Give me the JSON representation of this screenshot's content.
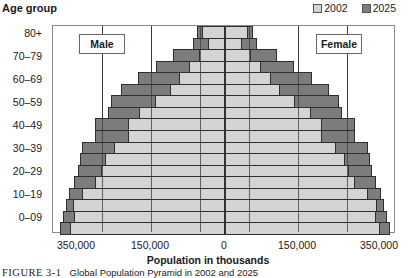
{
  "chart_data": {
    "type": "bar",
    "subtype": "population-pyramid",
    "title": "",
    "ylabel": "Age group",
    "xlabel": "Population in thousands",
    "categories": [
      "80+",
      "70–79",
      "60–69",
      "50–59",
      "40–49",
      "30–39",
      "20–29",
      "10–19",
      "0–09"
    ],
    "xticks": [
      "350,000",
      "150,000",
      "0",
      "150,000",
      "350,000"
    ],
    "xlim": [
      -350000,
      350000
    ],
    "gridlines_thousands": [
      -250000,
      -150000,
      -50000,
      0,
      50000,
      150000,
      250000
    ],
    "legend": [
      "2002",
      "2025"
    ],
    "legend_position": "top-right",
    "panels": [
      "Male",
      "Female"
    ],
    "note": "Each age group is drawn as two stacked sub-bars (upper and lower half of the decade); values in thousands, estimated from pixel extents.",
    "series": [
      {
        "name": "2002",
        "color": "#d4d4d4",
        "male": [
          47000,
          35000,
          53000,
          73000,
          93000,
          112000,
          142000,
          175000,
          198000,
          198000,
          225000,
          244000,
          252000,
          265000,
          290000,
          309000,
          307000,
          315000
        ],
        "female": [
          47000,
          35000,
          53000,
          73000,
          93000,
          112000,
          142000,
          175000,
          198000,
          198000,
          225000,
          244000,
          252000,
          265000,
          290000,
          309000,
          307000,
          315000
        ]
      },
      {
        "name": "2025",
        "color": "#7c7c7c",
        "male": [
          57000,
          65000,
          106000,
          140000,
          177000,
          212000,
          232000,
          238000,
          265000,
          265000,
          291000,
          295000,
          299000,
          307000,
          318000,
          324000,
          330000,
          336000
        ],
        "female": [
          57000,
          65000,
          106000,
          140000,
          177000,
          212000,
          232000,
          238000,
          265000,
          265000,
          291000,
          295000,
          299000,
          307000,
          318000,
          324000,
          330000,
          336000
        ]
      }
    ]
  },
  "header": {
    "y_title": "Age group",
    "legend": [
      {
        "label": "2002",
        "color": "#d4d4d4"
      },
      {
        "label": "2025",
        "color": "#7c7c7c"
      }
    ]
  },
  "panels": {
    "male": "Male",
    "female": "Female"
  },
  "x_axis": {
    "ticks": [
      "350,000",
      "150,000",
      "0",
      "150,000",
      "350,000"
    ],
    "title": "Population in thousands"
  },
  "y_axis": {
    "labels": [
      "80+",
      "70–79",
      "60–69",
      "50–59",
      "40–49",
      "30–39",
      "20–29",
      "10–19",
      "0–09"
    ]
  },
  "caption": {
    "label": "FIGURE 3-1",
    "text": "Global Population Pyramid in 2002 and 2025"
  }
}
